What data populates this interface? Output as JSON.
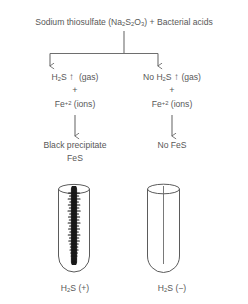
{
  "diagram": {
    "title_text": "Sodium thiosulfate (Na2S2O3) + Bacterial acids",
    "title": {
      "lead": "Sodium thiosulfate (Na",
      "sub1": "2",
      "mid1": "S",
      "sub2": "2",
      "mid2": "O",
      "sub3": "3",
      "tail": ") + Bacterial acids"
    },
    "left_branch": {
      "gas_lead": "H",
      "gas_sub": "2",
      "gas_mid": "S",
      "gas_arrow": "↑",
      "gas_tail": "(gas)",
      "plus": "+",
      "ion_lead": "Fe",
      "ion_sup": "+2",
      "ion_tail": "(ions)",
      "product_line1": "Black precipitate",
      "product_line2": "FeS",
      "caption_lead": "H",
      "caption_sub": "2",
      "caption_tail": "S (+)"
    },
    "right_branch": {
      "gas_lead": "No H",
      "gas_sub": "2",
      "gas_mid": "S",
      "gas_arrow": "↑",
      "gas_tail": "(gas)",
      "plus": "+",
      "ion_lead": "Fe",
      "ion_sup": "+2",
      "ion_tail": "(ions)",
      "product_line1": "No FeS",
      "caption_lead": "H",
      "caption_sub": "2",
      "caption_tail": "S (−)"
    },
    "colors": {
      "text": "#585858",
      "line": "#6e6e6e",
      "tube_outline": "#5b5b5b",
      "precipitate": "#1a1a1a",
      "background": "#ffffff"
    },
    "tubes": {
      "left": {
        "label": "tube-positive",
        "content": "black-precipitate-streak"
      },
      "right": {
        "label": "tube-negative",
        "content": "clear-stab-line"
      }
    }
  }
}
